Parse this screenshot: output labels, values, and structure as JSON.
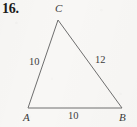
{
  "figure": {
    "problem_number": "16.",
    "shape": "triangle",
    "background_color": "#f8f7f5",
    "stroke_color": "#6e6e6e",
    "text_color": "#3a3a3a",
    "vertices": [
      {
        "name": "C",
        "label": "C",
        "x": 58,
        "y": 20,
        "label_x": 55,
        "label_y": 3
      },
      {
        "name": "A",
        "label": "A",
        "x": 28,
        "y": 108,
        "label_x": 23,
        "label_y": 112
      },
      {
        "name": "B",
        "label": "B",
        "x": 122,
        "y": 108,
        "label_x": 119,
        "label_y": 112
      }
    ],
    "sides": [
      {
        "name": "side-AC",
        "from": "A",
        "to": "C",
        "length_label": "10",
        "label_x": 29,
        "label_y": 57
      },
      {
        "name": "side-CB",
        "from": "C",
        "to": "B",
        "length_label": "12",
        "label_x": 95,
        "label_y": 55
      },
      {
        "name": "side-AB",
        "from": "A",
        "to": "B",
        "length_label": "10",
        "label_x": 68,
        "label_y": 111
      }
    ]
  }
}
